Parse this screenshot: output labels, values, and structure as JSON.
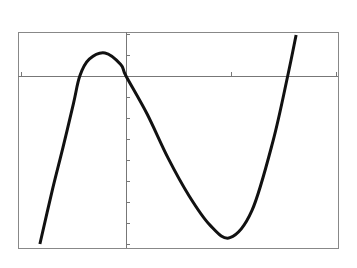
{
  "chart_data": {
    "type": "line",
    "title": "",
    "xlabel": "",
    "ylabel": "",
    "grid": false,
    "legend": null,
    "style": "graphing-calculator screen capture, pixelated black curve, thin gray axes and frame",
    "xlim": [
      -1.01,
      2.02
    ],
    "ylim": [
      -8.2,
      2.1
    ],
    "x_tick_step": 1,
    "y_tick_step": 1,
    "x_ticks": [
      -1,
      0,
      1,
      2
    ],
    "y_ticks": [
      -8,
      -7,
      -6,
      -5,
      -4,
      -3,
      -2,
      -1,
      0,
      1,
      2
    ],
    "tick_labels_shown": false,
    "series": [
      {
        "name": "cubic",
        "x": [
          -0.82,
          -0.7,
          -0.6,
          -0.5,
          -0.44,
          -0.35,
          -0.2,
          -0.05,
          0,
          0.2,
          0.4,
          0.6,
          0.8,
          0.99,
          1.2,
          1.4,
          1.54,
          1.62
        ],
        "y": [
          -8.0,
          -5.4,
          -3.4,
          -1.3,
          0,
          0.8,
          1.1,
          0.55,
          0,
          -1.8,
          -3.9,
          -5.7,
          -7.1,
          -7.7,
          -6.4,
          -3.1,
          0,
          1.95
        ]
      }
    ],
    "key_points": {
      "x_intercepts": [
        -0.44,
        0,
        1.54
      ],
      "local_max": {
        "x": -0.2,
        "y": 1.1
      },
      "local_min": {
        "x": 0.99,
        "y": -7.7
      }
    },
    "colors": {
      "curve": "#111111",
      "axes": "#777777",
      "frame": "#888888",
      "background": "#ffffff"
    }
  },
  "layout": {
    "frame": {
      "x": 18,
      "y": 32,
      "w": 320,
      "h": 216
    },
    "origin_px": {
      "x": 126,
      "y": 76
    },
    "px_per_x_unit": 105,
    "px_per_y_unit": 21
  }
}
